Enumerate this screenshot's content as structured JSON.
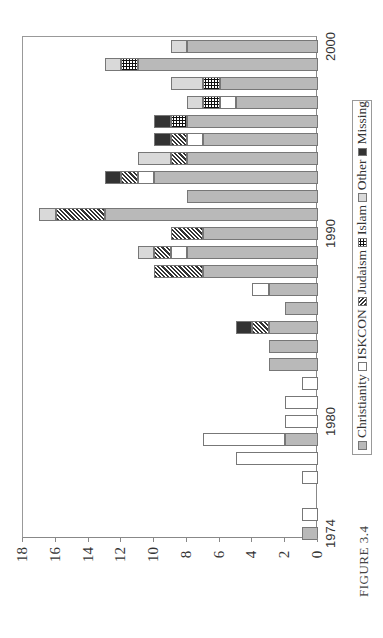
{
  "caption": "FIGURE 3.4",
  "chart_data": {
    "type": "bar",
    "stacked": true,
    "orientation": "vertical bars, figure rotated 90° counter-clockwise on page",
    "title": "",
    "xlabel": "",
    "ylabel": "",
    "ylim": [
      0,
      18
    ],
    "y_ticks": [
      0,
      2,
      4,
      6,
      8,
      10,
      12,
      14,
      16,
      18
    ],
    "x_tick_labels": [
      "1974",
      "1980",
      "1990",
      "2000"
    ],
    "categories": [
      "1974",
      "1975",
      "1976",
      "1977",
      "1978",
      "1979",
      "1980",
      "1981",
      "1982",
      "1983",
      "1984",
      "1985",
      "1986",
      "1987",
      "1988",
      "1989",
      "1990",
      "1991",
      "1992",
      "1993",
      "1994",
      "1995",
      "1996",
      "1997",
      "1998",
      "1999",
      "2000"
    ],
    "series": [
      {
        "name": "Christianity",
        "color": "#b9b9b9",
        "values": [
          1,
          0,
          0,
          0,
          0,
          2,
          0,
          0,
          0,
          3,
          3,
          3,
          2,
          3,
          7,
          8,
          7,
          13,
          8,
          10,
          8,
          7,
          8,
          5,
          6,
          11,
          8
        ]
      },
      {
        "name": "ISKCON",
        "color": "#ffffff",
        "values": [
          0,
          1,
          0,
          1,
          5,
          5,
          2,
          2,
          1,
          0,
          0,
          0,
          0,
          1,
          0,
          1,
          0,
          0,
          0,
          1,
          0,
          1,
          0,
          1,
          0,
          0,
          0
        ]
      },
      {
        "name": "Judaism",
        "color": "hatched",
        "values": [
          0,
          0,
          0,
          0,
          0,
          0,
          0,
          0,
          0,
          0,
          0,
          1,
          0,
          0,
          3,
          1,
          2,
          3,
          0,
          1,
          1,
          1,
          0,
          0,
          0,
          0,
          0
        ]
      },
      {
        "name": "Islam",
        "color": "grid",
        "values": [
          0,
          0,
          0,
          0,
          0,
          0,
          0,
          0,
          0,
          0,
          0,
          0,
          0,
          0,
          0,
          0,
          0,
          0,
          0,
          0,
          0,
          0,
          1,
          1,
          1,
          1,
          0
        ]
      },
      {
        "name": "Other",
        "color": "#d9d9d9",
        "values": [
          0,
          0,
          0,
          0,
          0,
          0,
          0,
          0,
          0,
          0,
          0,
          0,
          0,
          0,
          0,
          1,
          0,
          1,
          0,
          0,
          2,
          0,
          0,
          1,
          2,
          1,
          1
        ]
      },
      {
        "name": "Missing",
        "color": "#333333",
        "values": [
          0,
          0,
          0,
          0,
          0,
          0,
          0,
          0,
          0,
          0,
          0,
          1,
          0,
          0,
          0,
          0,
          0,
          0,
          0,
          1,
          0,
          1,
          1,
          0,
          0,
          0,
          0
        ]
      }
    ],
    "totals": [
      1,
      1,
      0,
      1,
      5,
      7,
      2,
      2,
      1,
      3,
      3,
      5,
      2,
      4,
      10,
      11,
      9,
      17,
      8,
      13,
      11,
      10,
      10,
      8,
      9,
      13,
      9
    ],
    "legend": [
      "Christianity",
      "ISKCON",
      "Judaism",
      "Islam",
      "Other",
      "Missing"
    ],
    "legend_position": "right (bottom of rotated figure)",
    "grid": false
  }
}
